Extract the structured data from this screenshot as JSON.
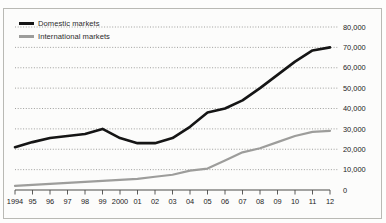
{
  "figure": {
    "top_sliver_text": "",
    "background": "#fdfdfc",
    "frame_color": "#b9b9b4"
  },
  "legend": {
    "position": "top-left",
    "items": [
      {
        "label": "Domestic markets",
        "color": "#151515",
        "style": "thick-solid"
      },
      {
        "label": "International markets",
        "color": "#9d9d9b",
        "style": "medium-solid"
      }
    ]
  },
  "chart_data": {
    "type": "line",
    "title": "",
    "subtitle": "",
    "xlabel": "",
    "ylabel": "",
    "grid": true,
    "grid_style": "dotted-horizontal",
    "legend_position": "top-left",
    "y_axis_position": "right",
    "ylim": [
      0,
      80000
    ],
    "yticks": [
      0,
      10000,
      20000,
      30000,
      40000,
      50000,
      60000,
      70000,
      80000
    ],
    "ytick_labels": [
      "0",
      "10,000",
      "20,000",
      "30,000",
      "40,000",
      "50,000",
      "60,000",
      "70,000",
      "80,000"
    ],
    "x": [
      1994,
      1995,
      1996,
      1997,
      1998,
      1999,
      2000,
      2001,
      2002,
      2003,
      2004,
      2005,
      2006,
      2007,
      2008,
      2009,
      2010,
      2011,
      2012
    ],
    "xtick_labels": [
      "1994",
      "95",
      "96",
      "97",
      "98",
      "99",
      "2000",
      "01",
      "02",
      "03",
      "04",
      "05",
      "06",
      "07",
      "08",
      "09",
      "10",
      "11",
      "12"
    ],
    "series": [
      {
        "name": "Domestic markets",
        "color": "#151515",
        "width": 2.6,
        "values": [
          21000,
          23500,
          25500,
          26500,
          27500,
          30000,
          25500,
          23000,
          23000,
          25500,
          31000,
          38000,
          40000,
          44000,
          50000,
          56500,
          63000,
          68500,
          70000
        ]
      },
      {
        "name": "International markets",
        "color": "#9d9d9b",
        "width": 2.2,
        "values": [
          2000,
          2500,
          3000,
          3500,
          4000,
          4500,
          5000,
          5500,
          6500,
          7500,
          9500,
          10500,
          14500,
          18500,
          20500,
          23500,
          26500,
          28500,
          29000
        ]
      }
    ]
  }
}
